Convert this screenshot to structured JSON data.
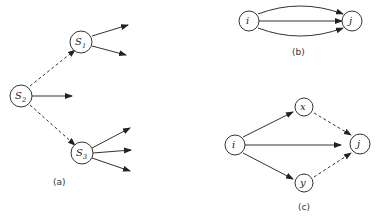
{
  "diagram_a": {
    "caption": "(a)",
    "nodes": [
      {
        "id": "S2",
        "label": "S",
        "subscript": "2"
      },
      {
        "id": "S1",
        "label": "S",
        "subscript": "1"
      },
      {
        "id": "S3",
        "label": "S",
        "subscript": "3"
      }
    ],
    "edges": [
      {
        "from": "S2",
        "to": "S1",
        "style": "dashed"
      },
      {
        "from": "S2",
        "to": "S3",
        "style": "dashed"
      },
      {
        "from": "S2",
        "to": null,
        "style": "solid",
        "count": 1
      },
      {
        "from": "S1",
        "to": null,
        "style": "solid",
        "count": 2
      },
      {
        "from": "S3",
        "to": null,
        "style": "solid",
        "count": 3
      }
    ]
  },
  "diagram_b": {
    "caption": "(b)",
    "nodes": [
      {
        "id": "i",
        "label": "i"
      },
      {
        "id": "j",
        "label": "j"
      }
    ],
    "edges": [
      {
        "from": "i",
        "to": "j",
        "style": "solid",
        "shape": "curved-up"
      },
      {
        "from": "i",
        "to": "j",
        "style": "solid",
        "shape": "straight"
      },
      {
        "from": "i",
        "to": "j",
        "style": "solid",
        "shape": "curved-down"
      }
    ]
  },
  "diagram_c": {
    "caption": "(c)",
    "nodes": [
      {
        "id": "i",
        "label": "i"
      },
      {
        "id": "x",
        "label": "x"
      },
      {
        "id": "y",
        "label": "y"
      },
      {
        "id": "j",
        "label": "j"
      }
    ],
    "edges": [
      {
        "from": "i",
        "to": "x",
        "style": "solid"
      },
      {
        "from": "i",
        "to": "y",
        "style": "solid"
      },
      {
        "from": "i",
        "to": "j",
        "style": "solid"
      },
      {
        "from": "x",
        "to": "j",
        "style": "dashed"
      },
      {
        "from": "y",
        "to": "j",
        "style": "dashed"
      }
    ]
  }
}
